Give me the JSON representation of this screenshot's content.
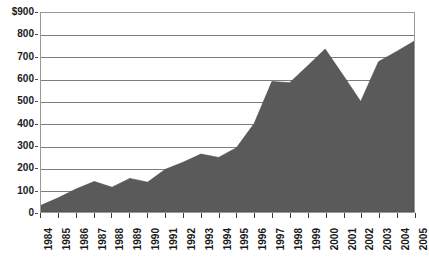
{
  "chart_data": {
    "type": "area",
    "title": "",
    "subtitle": "",
    "xlabel": "",
    "ylabel": "",
    "categories": [
      "1984",
      "1985",
      "1986",
      "1987",
      "1988",
      "1989",
      "1990",
      "1991",
      "1992",
      "1993",
      "1994",
      "1995",
      "1996",
      "1997",
      "1998",
      "1999",
      "2000",
      "2001",
      "2002",
      "2003",
      "2004",
      "2005"
    ],
    "values": [
      30,
      65,
      105,
      138,
      112,
      152,
      135,
      193,
      225,
      262,
      247,
      290,
      400,
      590,
      585,
      660,
      737,
      620,
      500,
      680,
      725,
      772
    ],
    "series": [
      {
        "name": "",
        "values": [
          30,
          65,
          105,
          138,
          112,
          152,
          135,
          193,
          225,
          262,
          247,
          290,
          400,
          590,
          585,
          660,
          737,
          620,
          500,
          680,
          725,
          772
        ]
      }
    ],
    "ylim": [
      0,
      900
    ],
    "xlim": [
      "1984",
      "2005"
    ],
    "y_ticks": [
      0,
      100,
      200,
      300,
      400,
      500,
      600,
      700,
      800,
      900
    ],
    "y_tick_labels": [
      "0",
      "100",
      "200",
      "300",
      "400",
      "500",
      "600",
      "700",
      "800",
      "$900"
    ],
    "x_tick_labels": [
      "1984",
      "1985",
      "1986",
      "1987",
      "1988",
      "1989",
      "1990",
      "1991",
      "1992",
      "1993",
      "1994",
      "1995",
      "1996",
      "1997",
      "1998",
      "1999",
      "2000",
      "2001",
      "2002",
      "2003",
      "2004",
      "2005"
    ],
    "grid": true,
    "grid_axis": "y",
    "legend": false,
    "legend_position": "none",
    "annotations": [],
    "currency_symbol": "$",
    "area_fill_color": "#5a5a5a",
    "gridline_color": "#7d7d7d",
    "frame_color": "#9a9a9a",
    "background_color": "#ffffff",
    "text_color": "#1a1a1a"
  }
}
